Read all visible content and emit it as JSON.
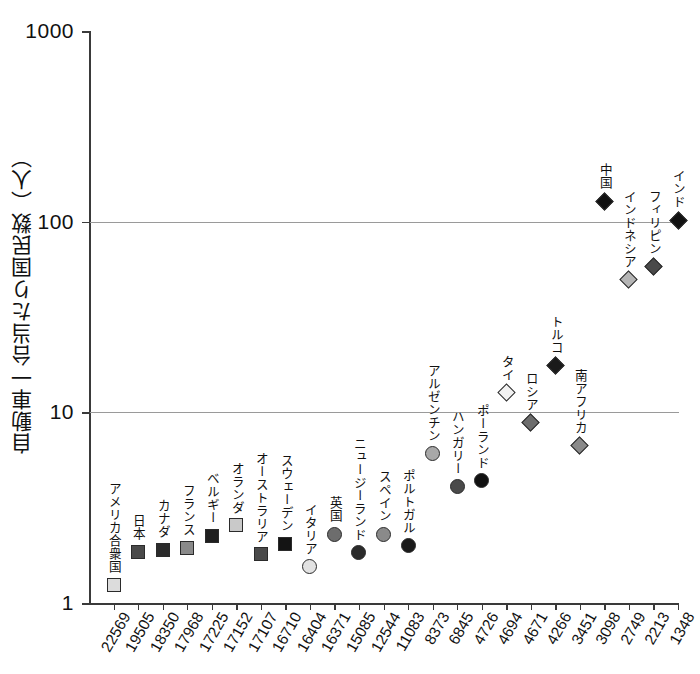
{
  "chart_data": {
    "type": "scatter",
    "title": "",
    "xlabel": "",
    "ylabel": "自動車一台当たり国民数（人）",
    "yscale": "log",
    "ylim": [
      1,
      1000
    ],
    "ytick_labels": [
      "1000",
      "100",
      "10",
      "1"
    ],
    "ytick_values": [
      1000,
      100,
      10,
      1
    ],
    "gridlines": [
      100,
      10
    ],
    "grid": true,
    "legend": "none",
    "categories": [
      "22569",
      "19505",
      "18350",
      "17968",
      "17225",
      "17152",
      "17107",
      "16710",
      "16404",
      "16371",
      "15085",
      "12544",
      "11083",
      "8373",
      "6845",
      "4726",
      "4694",
      "4671",
      "4266",
      "3451",
      "3098",
      "2749",
      "2213",
      "1348"
    ],
    "points": [
      {
        "label": "アメリカ合衆国",
        "x_label": "22569",
        "value": 1.25,
        "marker": "square",
        "fill": "#dcdcdc"
      },
      {
        "label": "日本",
        "x_label": "19505",
        "value": 1.85,
        "marker": "square",
        "fill": "#4a4a4a"
      },
      {
        "label": "カナダ",
        "x_label": "18350",
        "value": 1.9,
        "marker": "square",
        "fill": "#2b2b2b"
      },
      {
        "label": "フランス",
        "x_label": "17968",
        "value": 1.95,
        "marker": "square",
        "fill": "#8a8a8a"
      },
      {
        "label": "ベルギー",
        "x_label": "17225",
        "value": 2.25,
        "marker": "square",
        "fill": "#1f1f1f"
      },
      {
        "label": "オランダ",
        "x_label": "17152",
        "value": 2.55,
        "marker": "square",
        "fill": "#c9c9c9"
      },
      {
        "label": "オーストラリア",
        "x_label": "17107",
        "value": 1.8,
        "marker": "square",
        "fill": "#4a4a4a"
      },
      {
        "label": "スウェーデン",
        "x_label": "16710",
        "value": 2.05,
        "marker": "square",
        "fill": "#141414"
      },
      {
        "label": "イタリア",
        "x_label": "16404",
        "value": 1.55,
        "marker": "circle",
        "fill": "#e2e2e2"
      },
      {
        "label": "英国",
        "x_label": "16371",
        "value": 2.3,
        "marker": "circle",
        "fill": "#6d6d6d"
      },
      {
        "label": "ニュージーランド",
        "x_label": "15085",
        "value": 1.85,
        "marker": "circle",
        "fill": "#2b2b2b"
      },
      {
        "label": "スペイン",
        "x_label": "12544",
        "value": 2.3,
        "marker": "circle",
        "fill": "#8a8a8a"
      },
      {
        "label": "ポルトガル",
        "x_label": "11083",
        "value": 2.0,
        "marker": "circle",
        "fill": "#1a1a1a"
      },
      {
        "label": "アルゼンチン",
        "x_label": "8373",
        "value": 6.1,
        "marker": "circle",
        "fill": "#a8a8a8"
      },
      {
        "label": "ハンガリー",
        "x_label": "6845",
        "value": 4.1,
        "marker": "circle",
        "fill": "#4a4a4a"
      },
      {
        "label": "ポーランド",
        "x_label": "4726",
        "value": 4.4,
        "marker": "circle",
        "fill": "#111111"
      },
      {
        "label": "タイ",
        "x_label": "4694",
        "value": 12.7,
        "marker": "diamond",
        "fill": "#f2f2f2"
      },
      {
        "label": "ロシア",
        "x_label": "4671",
        "value": 8.8,
        "marker": "diamond",
        "fill": "#6d6d6d"
      },
      {
        "label": "トルコ",
        "x_label": "4266",
        "value": 17.5,
        "marker": "diamond",
        "fill": "#1a1a1a"
      },
      {
        "label": "南アフリカ",
        "x_label": "3451",
        "value": 6.7,
        "marker": "diamond",
        "fill": "#8a8a8a"
      },
      {
        "label": "中国",
        "x_label": "3098",
        "value": 128,
        "marker": "diamond",
        "fill": "#111111"
      },
      {
        "label": "インドネシア",
        "x_label": "2749",
        "value": 50,
        "marker": "diamond",
        "fill": "#b5b5b5"
      },
      {
        "label": "フィリピン",
        "x_label": "2213",
        "value": 58,
        "marker": "diamond",
        "fill": "#4a4a4a"
      },
      {
        "label": "インド",
        "x_label": "1348",
        "value": 102,
        "marker": "diamond",
        "fill": "#111111"
      }
    ]
  },
  "axis": {
    "y_title": "自動車一台当たり国民数（人）"
  }
}
